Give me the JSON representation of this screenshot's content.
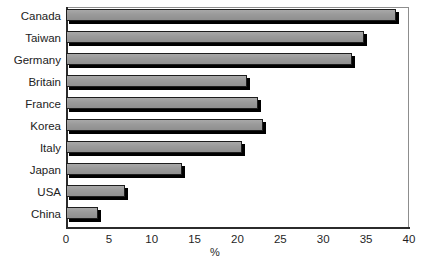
{
  "chart_data": {
    "type": "bar",
    "orientation": "horizontal",
    "title": "",
    "xlabel": "%",
    "ylabel": "",
    "xlim": [
      0,
      40
    ],
    "xticks": [
      0,
      5,
      10,
      15,
      20,
      25,
      30,
      35,
      40
    ],
    "xtick_labels": [
      "0",
      "5",
      "10",
      "15",
      "20",
      "25",
      "30",
      "35",
      "40"
    ],
    "grid": false,
    "legend": null,
    "categories": [
      "Canada",
      "Taiwan",
      "Germany",
      "Britain",
      "France",
      "Korea",
      "Italy",
      "Japan",
      "USA",
      "China"
    ],
    "values": [
      38.5,
      34.8,
      33.3,
      21.1,
      22.4,
      23.0,
      20.5,
      13.5,
      6.9,
      3.7
    ],
    "bars": [
      {
        "label": "Canada",
        "value": 38.5
      },
      {
        "label": "Taiwan",
        "value": 34.8
      },
      {
        "label": "Germany",
        "value": 33.3
      },
      {
        "label": "Britain",
        "value": 21.1
      },
      {
        "label": "France",
        "value": 22.4
      },
      {
        "label": "Korea",
        "value": 23.0
      },
      {
        "label": "Italy",
        "value": 20.5
      },
      {
        "label": "Japan",
        "value": 13.5
      },
      {
        "label": "USA",
        "value": 6.9
      },
      {
        "label": "China",
        "value": 3.7
      }
    ],
    "colors": {
      "bar_fill": "#9b9b9b",
      "bar_edge": "#1d1d1d",
      "bar_shadow": "#000000",
      "axis": "#2b2b2b",
      "frame": "#8d8d8d",
      "text": "#1f1f1f",
      "background": "#ffffff"
    }
  }
}
